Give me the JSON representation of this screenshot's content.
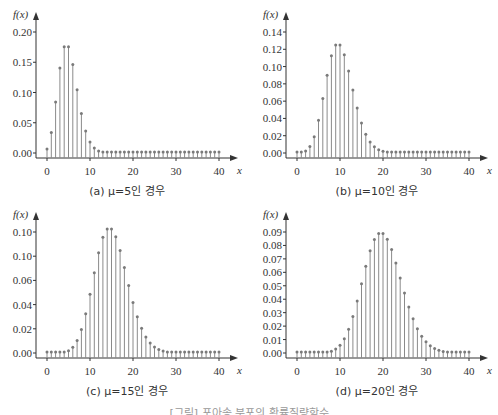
{
  "chart_data": [
    {
      "type": "bar",
      "subtype": "stem",
      "title": "",
      "caption": "(a) μ=5인 경우",
      "xlabel": "x",
      "ylabel": "f(x)",
      "xlim": [
        0,
        40
      ],
      "ylim": [
        0,
        0.2
      ],
      "xticks": [
        0,
        10,
        20,
        30,
        40
      ],
      "yticks": [
        "0.00",
        "0.05",
        "0.10",
        "0.15",
        "0.20"
      ],
      "grid": false,
      "x": [
        0,
        1,
        2,
        3,
        4,
        5,
        6,
        7,
        8,
        9,
        10,
        11,
        12,
        13,
        14,
        15,
        16,
        17,
        18,
        19,
        20,
        21,
        22,
        23,
        24,
        25,
        26,
        27,
        28,
        29,
        30,
        31,
        32,
        33,
        34,
        35,
        36,
        37,
        38,
        39,
        40
      ],
      "values": [
        0.0067,
        0.0337,
        0.0842,
        0.1404,
        0.1755,
        0.1755,
        0.1462,
        0.1044,
        0.0653,
        0.0363,
        0.0181,
        0.0082,
        0.0034,
        0.0013,
        0.0005,
        0.0002,
        0.0,
        0.0,
        0.0,
        0.0,
        0.0,
        0.0,
        0.0,
        0.0,
        0.0,
        0.0,
        0.0,
        0.0,
        0.0,
        0.0,
        0.0,
        0.0,
        0.0,
        0.0,
        0.0,
        0.0,
        0.0,
        0.0,
        0.0,
        0.0,
        0.0
      ]
    },
    {
      "type": "bar",
      "subtype": "stem",
      "title": "",
      "caption": "(b) μ=10인 경우",
      "xlabel": "x",
      "ylabel": "f(x)",
      "xlim": [
        0,
        40
      ],
      "ylim": [
        0,
        0.14
      ],
      "xticks": [
        0,
        10,
        20,
        30,
        40
      ],
      "yticks": [
        "0.00",
        "0.02",
        "0.04",
        "0.06",
        "0.08",
        "0.10",
        "0.12",
        "0.14"
      ],
      "grid": false,
      "x": [
        0,
        1,
        2,
        3,
        4,
        5,
        6,
        7,
        8,
        9,
        10,
        11,
        12,
        13,
        14,
        15,
        16,
        17,
        18,
        19,
        20,
        21,
        22,
        23,
        24,
        25,
        26,
        27,
        28,
        29,
        30,
        31,
        32,
        33,
        34,
        35,
        36,
        37,
        38,
        39,
        40
      ],
      "values": [
        0.0,
        0.0005,
        0.0023,
        0.0076,
        0.0189,
        0.0378,
        0.0631,
        0.0901,
        0.1126,
        0.1251,
        0.1251,
        0.1137,
        0.0948,
        0.0729,
        0.0521,
        0.0347,
        0.0217,
        0.0128,
        0.0071,
        0.0037,
        0.0019,
        0.0009,
        0.0004,
        0.0002,
        0.0001,
        0.0,
        0.0,
        0.0,
        0.0,
        0.0,
        0.0,
        0.0,
        0.0,
        0.0,
        0.0,
        0.0,
        0.0,
        0.0,
        0.0,
        0.0,
        0.0
      ]
    },
    {
      "type": "bar",
      "subtype": "stem",
      "title": "",
      "caption": "(c) μ=15인 경우",
      "xlabel": "x",
      "ylabel": "f(x)",
      "xlim": [
        0,
        40
      ],
      "ylim": [
        0,
        0.1
      ],
      "xticks": [
        0,
        10,
        20,
        30,
        40
      ],
      "yticks": [
        "0.00",
        "0.02",
        "0.04",
        "0.06",
        "0.10",
        "0.10"
      ],
      "grid": false,
      "x": [
        0,
        1,
        2,
        3,
        4,
        5,
        6,
        7,
        8,
        9,
        10,
        11,
        12,
        13,
        14,
        15,
        16,
        17,
        18,
        19,
        20,
        21,
        22,
        23,
        24,
        25,
        26,
        27,
        28,
        29,
        30,
        31,
        32,
        33,
        34,
        35,
        36,
        37,
        38,
        39,
        40
      ],
      "values": [
        0.0,
        0.0,
        0.0,
        0.0002,
        0.0006,
        0.0019,
        0.0048,
        0.0104,
        0.0194,
        0.0324,
        0.0486,
        0.0663,
        0.0829,
        0.0956,
        0.1024,
        0.1024,
        0.096,
        0.0847,
        0.0706,
        0.0557,
        0.0418,
        0.0299,
        0.0204,
        0.0133,
        0.0083,
        0.005,
        0.0029,
        0.0016,
        0.0009,
        0.0004,
        0.0002,
        0.0001,
        0.0,
        0.0,
        0.0,
        0.0,
        0.0,
        0.0,
        0.0,
        0.0,
        0.0
      ]
    },
    {
      "type": "bar",
      "subtype": "stem",
      "title": "",
      "caption": "(d) μ=20인 경우",
      "xlabel": "x",
      "ylabel": "f(x)",
      "xlim": [
        0,
        40
      ],
      "ylim": [
        0,
        0.09
      ],
      "xticks": [
        0,
        10,
        20,
        30,
        40
      ],
      "yticks": [
        "0.00",
        "0.01",
        "0.02",
        "0.03",
        "0.04",
        "0.05",
        "0.06",
        "0.07",
        "0.08",
        "0.09"
      ],
      "grid": false,
      "x": [
        0,
        1,
        2,
        3,
        4,
        5,
        6,
        7,
        8,
        9,
        10,
        11,
        12,
        13,
        14,
        15,
        16,
        17,
        18,
        19,
        20,
        21,
        22,
        23,
        24,
        25,
        26,
        27,
        28,
        29,
        30,
        31,
        32,
        33,
        34,
        35,
        36,
        37,
        38,
        39,
        40
      ],
      "values": [
        0.0,
        0.0,
        0.0,
        0.0,
        0.0,
        0.0001,
        0.0002,
        0.0005,
        0.0013,
        0.0029,
        0.0058,
        0.0106,
        0.0176,
        0.0271,
        0.0387,
        0.0516,
        0.0646,
        0.076,
        0.0844,
        0.0888,
        0.0888,
        0.0846,
        0.0769,
        0.0669,
        0.0557,
        0.0446,
        0.0343,
        0.0254,
        0.0181,
        0.0125,
        0.0083,
        0.0054,
        0.0034,
        0.002,
        0.0012,
        0.0007,
        0.0004,
        0.0002,
        0.0001,
        0.0001,
        0.0
      ]
    }
  ],
  "figure_caption": "[그림] 포아송 분포의 확률질량함수"
}
